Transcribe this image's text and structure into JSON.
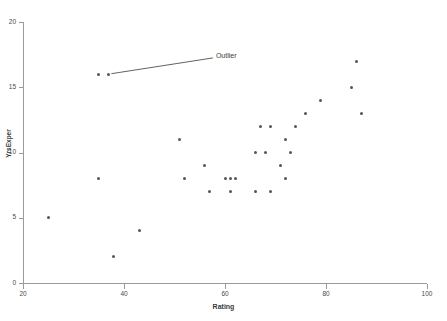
{
  "chart_data": {
    "type": "scatter",
    "title": "",
    "xlabel": "Rating",
    "ylabel": "YrsExper",
    "xlim": [
      20,
      100
    ],
    "ylim": [
      0,
      20
    ],
    "xticks": [
      20,
      40,
      60,
      80,
      100
    ],
    "yticks": [
      0,
      5,
      10,
      15,
      20
    ],
    "grid": false,
    "legend": null,
    "marker": "filled-circle",
    "marker_color": "#555555",
    "axis_color": "#9a9a9a",
    "points": [
      {
        "x": 25,
        "y": 5
      },
      {
        "x": 35,
        "y": 8
      },
      {
        "x": 35,
        "y": 16
      },
      {
        "x": 37,
        "y": 16
      },
      {
        "x": 38,
        "y": 2
      },
      {
        "x": 43,
        "y": 4
      },
      {
        "x": 51,
        "y": 11
      },
      {
        "x": 52,
        "y": 8
      },
      {
        "x": 56,
        "y": 9
      },
      {
        "x": 57,
        "y": 7
      },
      {
        "x": 60,
        "y": 8
      },
      {
        "x": 61,
        "y": 7
      },
      {
        "x": 61,
        "y": 8
      },
      {
        "x": 62,
        "y": 8
      },
      {
        "x": 66,
        "y": 10
      },
      {
        "x": 66,
        "y": 7
      },
      {
        "x": 67,
        "y": 12
      },
      {
        "x": 68,
        "y": 10
      },
      {
        "x": 69,
        "y": 12
      },
      {
        "x": 69,
        "y": 7
      },
      {
        "x": 71,
        "y": 9
      },
      {
        "x": 72,
        "y": 11
      },
      {
        "x": 72,
        "y": 8
      },
      {
        "x": 73,
        "y": 10
      },
      {
        "x": 74,
        "y": 12
      },
      {
        "x": 76,
        "y": 13
      },
      {
        "x": 79,
        "y": 14
      },
      {
        "x": 85,
        "y": 15
      },
      {
        "x": 86,
        "y": 17
      },
      {
        "x": 87,
        "y": 13
      }
    ],
    "annotations": [
      {
        "text": "Outlier",
        "target_x": 37,
        "target_y": 16,
        "label_x": 58,
        "label_y": 17.4
      }
    ]
  }
}
